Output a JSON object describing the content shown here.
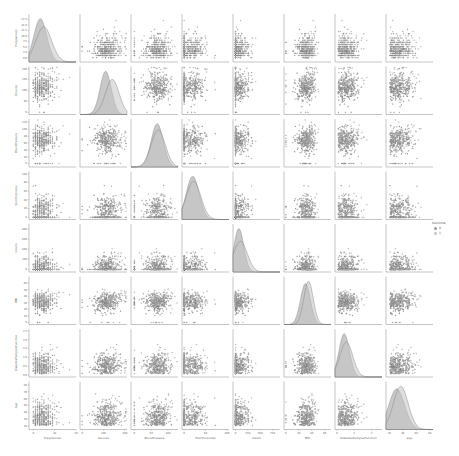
{
  "chart_data": {
    "type": "pairplot",
    "title": "",
    "hue": "Outcome",
    "variables": [
      "Pregnancies",
      "Glucose",
      "BloodPressure",
      "SkinThickness",
      "Insulin",
      "BMI",
      "DiabetesPedigreeFunction",
      "Age"
    ],
    "axis_ranges": {
      "Pregnancies": [
        -2,
        20
      ],
      "Glucose": [
        -10,
        210
      ],
      "BloodPressure": [
        -10,
        130
      ],
      "SkinThickness": [
        -5,
        105
      ],
      "Insulin": [
        -50,
        900
      ],
      "BMI": [
        -3,
        70
      ],
      "DiabetesPedigreeFunction": [
        -0.1,
        2.6
      ],
      "Age": [
        15,
        85
      ]
    },
    "x_ticks": {
      "Pregnancies": [
        "0",
        "10",
        "20"
      ],
      "Glucose": [
        "0",
        "100",
        "200"
      ],
      "BloodPressure": [
        "0",
        "50",
        "100"
      ],
      "SkinThickness": [
        "0",
        "50",
        "100"
      ],
      "Insulin": [
        "0",
        "250",
        "500",
        "750",
        "1000"
      ],
      "BMI": [
        "0",
        "20",
        "40",
        "60"
      ],
      "DiabetesPedigreeFunction": [
        "0",
        "1",
        "2"
      ],
      "Age": [
        "20",
        "40",
        "60",
        "80"
      ]
    },
    "y_ticks": {
      "Pregnancies": [
        "0.0",
        "2.5",
        "5.0",
        "7.5",
        "10.0",
        "12.5",
        "15.0",
        "17.5"
      ],
      "Glucose": [
        "0",
        "50",
        "100",
        "150",
        "200"
      ],
      "BloodPressure": [
        "0",
        "20",
        "40",
        "60",
        "80",
        "100",
        "120"
      ],
      "SkinThickness": [
        "0",
        "20",
        "40",
        "60",
        "80",
        "100"
      ],
      "Insulin": [
        "0",
        "200",
        "400",
        "600",
        "800"
      ],
      "BMI": [
        "0",
        "10",
        "20",
        "30",
        "40",
        "50",
        "60"
      ],
      "DiabetesPedigreeFunction": [
        "0.0",
        "0.5",
        "1.0",
        "1.5",
        "2.0",
        "2.5"
      ],
      "Age": [
        "20",
        "30",
        "40",
        "50",
        "60",
        "70",
        "80"
      ]
    },
    "series": [
      {
        "name": "0",
        "color": "#9a9a9a"
      },
      {
        "name": "1",
        "color": "#c4c4c4"
      }
    ],
    "distributions": {
      "Pregnancies": {
        "0": {
          "mean": 3.3,
          "sd": 3.0
        },
        "1": {
          "mean": 4.9,
          "sd": 3.7
        }
      },
      "Glucose": {
        "0": {
          "mean": 110,
          "sd": 26
        },
        "1": {
          "mean": 141,
          "sd": 32
        }
      },
      "BloodPressure": {
        "0": {
          "mean": 68,
          "sd": 18
        },
        "1": {
          "mean": 71,
          "sd": 21
        }
      },
      "SkinThickness": {
        "0": {
          "mean": 20,
          "sd": 15
        },
        "1": {
          "mean": 22,
          "sd": 17
        }
      },
      "Insulin": {
        "0": {
          "mean": 69,
          "sd": 98
        },
        "1": {
          "mean": 100,
          "sd": 138
        }
      },
      "BMI": {
        "0": {
          "mean": 30.3,
          "sd": 7.7
        },
        "1": {
          "mean": 35.1,
          "sd": 7.3
        }
      },
      "DiabetesPedigreeFunction": {
        "0": {
          "mean": 0.43,
          "sd": 0.3
        },
        "1": {
          "mean": 0.55,
          "sd": 0.37
        }
      },
      "Age": {
        "0": {
          "mean": 31,
          "sd": 11.7
        },
        "1": {
          "mean": 37,
          "sd": 11
        }
      }
    },
    "n_points": {
      "0": 500,
      "1": 268
    },
    "legend_position": "right",
    "grid": false
  },
  "legend": {
    "title": "Outcome",
    "items": [
      {
        "label": "0",
        "color": "#9a9a9a"
      },
      {
        "label": "1",
        "color": "#c4c4c4"
      }
    ]
  },
  "layout": {
    "left": 29,
    "top": 14,
    "pitch_x": 51,
    "pitch_y": 52.5,
    "panel_w": 47,
    "panel_h": 48
  }
}
